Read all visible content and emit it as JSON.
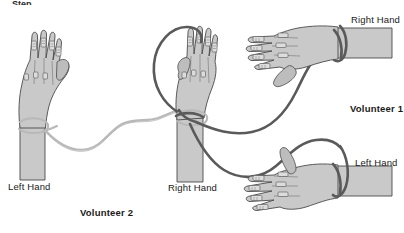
{
  "figure": {
    "background_color": "#ffffff",
    "top_cropped_fragment": "Step"
  },
  "labels": {
    "left_hand_v2": "Left Hand",
    "right_hand_v2": "Right Hand",
    "volunteer_2": "Volunteer 2",
    "right_hand_v1": "Right Hand",
    "volunteer_1": "Volunteer 1",
    "left_hand_v1": "Left Hand"
  },
  "colors": {
    "skin_fill": "#c9c9c9",
    "skin_fill_shadow": "#b4b4b4",
    "outline": "#4a4a4a",
    "cord_light": "#b9b9b9",
    "cord_dark": "#5a5a5a",
    "electrode_fill": "#dcdcdc",
    "text": "#1a1a1a"
  },
  "hands": [
    {
      "id": "hand-left-volunteer-2",
      "label": "Left Hand",
      "volunteer": "Volunteer 2",
      "orientation": "vertical-up",
      "side": "left",
      "view": "palm",
      "finger_electrodes": 4,
      "wrist_cord": "light",
      "position": {
        "x": 12,
        "y": 24
      }
    },
    {
      "id": "hand-right-volunteer-2",
      "label": "Right Hand",
      "volunteer": "Volunteer 2",
      "orientation": "vertical-up",
      "side": "right",
      "view": "dorsal",
      "finger_electrodes": 4,
      "wrist_cord": "light-and-dark",
      "position": {
        "x": 162,
        "y": 24
      }
    },
    {
      "id": "hand-right-volunteer-1",
      "label": "Right Hand",
      "volunteer": "Volunteer 1",
      "orientation": "horizontal-left",
      "side": "right",
      "view": "dorsal",
      "finger_electrodes": 4,
      "wrist_cord": "dark",
      "position": {
        "x": 246,
        "y": 14
      }
    },
    {
      "id": "hand-left-volunteer-1",
      "label": "Left Hand",
      "volunteer": "Volunteer 1",
      "orientation": "horizontal-left",
      "side": "left",
      "view": "dorsal",
      "finger_electrodes": 4,
      "wrist_cord": "dark",
      "position": {
        "x": 240,
        "y": 152
      }
    }
  ],
  "cords": [
    {
      "id": "cord-light-v2-left-to-right",
      "style": "light",
      "from": "hand-left-volunteer-2 wrist",
      "to": "hand-right-volunteer-2 wrist"
    },
    {
      "id": "cord-dark-loop-over-center",
      "style": "dark",
      "from": "hand-right-volunteer-2 wrist",
      "to": "hand-right-volunteer-2 wrist",
      "shape": "arc-over-top-left"
    },
    {
      "id": "cord-dark-to-v1-right-hand",
      "style": "dark",
      "from": "hand-right-volunteer-2 wrist",
      "to": "hand-right-volunteer-1 wrist"
    },
    {
      "id": "cord-dark-to-v1-left-hand",
      "style": "dark",
      "from": "hand-right-volunteer-2 wrist",
      "to": "hand-left-volunteer-1 wrist"
    }
  ]
}
